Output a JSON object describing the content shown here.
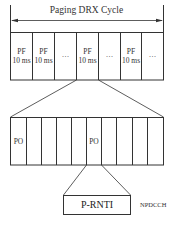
{
  "diagram": {
    "cycle_label": "Paging DRX Cycle",
    "top_row": {
      "cells": [
        {
          "line1": "PF",
          "line2": "10 ms"
        },
        {
          "line1": "PF",
          "line2": "10 ms"
        },
        {
          "line1": "···",
          "line2": ""
        },
        {
          "line1": "PF",
          "line2": "10 ms"
        },
        {
          "line1": "···",
          "line2": ""
        },
        {
          "line1": "PF",
          "line2": "10 ms"
        },
        {
          "line1": "···",
          "line2": ""
        }
      ],
      "expanded_cell_index": 3
    },
    "bottom_row": {
      "cells": [
        "PO",
        "",
        "",
        "",
        "",
        "PO",
        "",
        "",
        "",
        ""
      ],
      "expanded_cell_index": 5
    },
    "pdcch_box": {
      "label": "P-RNTI"
    },
    "channel_label": "NPDCCH",
    "line_color": "#333333"
  }
}
